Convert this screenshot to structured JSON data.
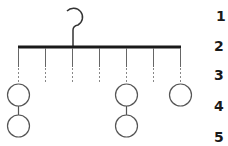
{
  "diagram": {
    "title": "",
    "hanger": {
      "bar": {
        "x1": 18,
        "x2": 181,
        "y": 47,
        "color": "#1a1a1a",
        "thickness": 3
      },
      "hook": {
        "cx": 77,
        "cy": 15,
        "r": 8,
        "stem_x": 73,
        "stem_top": 27,
        "stem_bottom": 47
      },
      "drops": [
        18,
        45,
        72,
        99,
        126,
        153,
        180
      ]
    },
    "circles": [
      {
        "column": 1,
        "row": 4
      },
      {
        "column": 1,
        "row": 5
      },
      {
        "column": 5,
        "row": 4
      },
      {
        "column": 5,
        "row": 5
      },
      {
        "column": 7,
        "row": 4
      }
    ],
    "row_labels": [
      "1",
      "2",
      "3",
      "4",
      "5"
    ],
    "colors": {
      "line": "#555555",
      "bar": "#1a1a1a",
      "circle": "#555555",
      "label": "#1a1a1a"
    }
  }
}
